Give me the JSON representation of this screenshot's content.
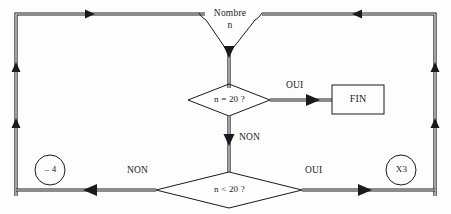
{
  "diagram": {
    "language": "fr",
    "background_color": "#fdfdfd",
    "stroke_color": "#1a1a1a",
    "nodes": {
      "input_merge": {
        "name": "input-merge",
        "label_line1": "Nombre",
        "label_line2": "n",
        "shape": "funnel"
      },
      "decision_equal": {
        "name": "decision-equal",
        "label": "n = 20 ?",
        "shape": "diamond"
      },
      "decision_less": {
        "name": "decision-less",
        "label": "n < 20 ?",
        "shape": "diamond"
      },
      "terminal_end": {
        "name": "terminal-end",
        "label": "FIN",
        "shape": "rectangle"
      },
      "op_minus": {
        "name": "operation-minus-four",
        "label": "– 4",
        "shape": "circle"
      },
      "op_times": {
        "name": "operation-times-three",
        "label": "X3",
        "shape": "circle"
      }
    },
    "edge_labels": {
      "equal_yes": "OUI",
      "equal_no": "NON",
      "less_no": "NON",
      "less_yes": "OUI"
    }
  }
}
